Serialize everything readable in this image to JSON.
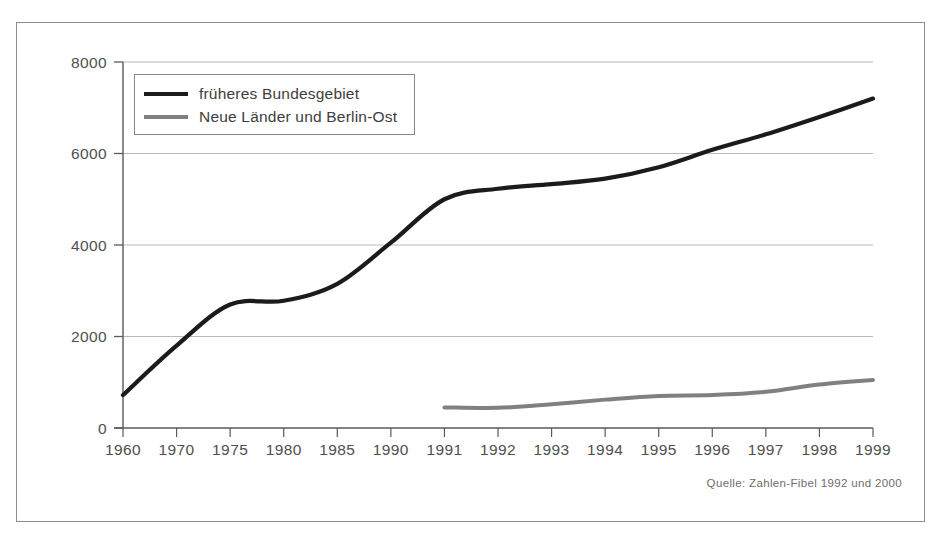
{
  "chart_data": {
    "type": "line",
    "title": "",
    "xlabel": "",
    "ylabel": "",
    "ylim": [
      0,
      8000
    ],
    "yticks": [
      0,
      2000,
      4000,
      6000,
      8000
    ],
    "grid": true,
    "legend_position": "top-left",
    "categories": [
      "1960",
      "1970",
      "1975",
      "1980",
      "1985",
      "1990",
      "1991",
      "1992",
      "1993",
      "1994",
      "1995",
      "1996",
      "1997",
      "1998",
      "1999"
    ],
    "series": [
      {
        "name": "früheres Bundesgebiet",
        "color": "#1b1b1b",
        "values": [
          720,
          1800,
          2700,
          2780,
          3150,
          4050,
          5000,
          5230,
          5330,
          5450,
          5700,
          6080,
          6420,
          6800,
          7200
        ]
      },
      {
        "name": "Neue Länder und Berlin-Ost",
        "color": "#808080",
        "values": [
          null,
          null,
          null,
          null,
          null,
          null,
          450,
          440,
          520,
          620,
          700,
          720,
          790,
          950,
          1050
        ]
      }
    ],
    "source_note": "Quelle: Zahlen-Fibel 1992 und 2000"
  },
  "legend": {
    "items": [
      {
        "label": "früheres Bundesgebiet",
        "color": "#1b1b1b"
      },
      {
        "label": "Neue Länder und Berlin-Ost",
        "color": "#808080"
      }
    ]
  },
  "axes": {
    "y_tick_labels": [
      "8000",
      "6000",
      "4000",
      "2000",
      "0"
    ],
    "x_tick_labels": [
      "1960",
      "1970",
      "1975",
      "1980",
      "1985",
      "1990",
      "1991",
      "1992",
      "1993",
      "1994",
      "1995",
      "1996",
      "1997",
      "1998",
      "1999"
    ]
  },
  "footer": {
    "source": "Quelle: Zahlen-Fibel 1992 und 2000"
  },
  "colors": {
    "frame": "#8d8d8d",
    "gridline": "#b9b9b9",
    "axis": "#5a5a5a",
    "series_west": "#1b1b1b",
    "series_east": "#808080",
    "text": "#4f4f4f"
  }
}
